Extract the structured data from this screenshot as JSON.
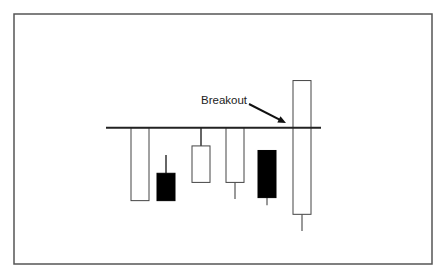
{
  "chart_data": {
    "type": "candlestick",
    "title": "",
    "xlabel": "",
    "ylabel": "",
    "grid": false,
    "legend": "none",
    "ylim": [
      0,
      100
    ],
    "resistance_level": 66,
    "annotation": {
      "text": "Breakout",
      "target_candle": 6,
      "arrow": true
    },
    "candles": [
      {
        "index": 1,
        "direction": "up",
        "open": 18,
        "close": 66,
        "high": 66,
        "low": 18
      },
      {
        "index": 2,
        "direction": "down",
        "open": 36,
        "close": 18,
        "high": 48,
        "low": 18
      },
      {
        "index": 3,
        "direction": "up",
        "open": 30,
        "close": 54,
        "high": 66,
        "low": 30
      },
      {
        "index": 4,
        "direction": "up",
        "open": 30,
        "close": 66,
        "high": 66,
        "low": 19
      },
      {
        "index": 5,
        "direction": "down",
        "open": 51,
        "close": 20,
        "high": 51,
        "low": 15
      },
      {
        "index": 6,
        "direction": "up",
        "open": 9,
        "close": 97,
        "high": 97,
        "low": -2
      }
    ],
    "colors": {
      "up_fill": "#ffffff",
      "down_fill": "#000000",
      "stroke": "#444444",
      "line": "#222222",
      "frame": "#555555"
    }
  }
}
